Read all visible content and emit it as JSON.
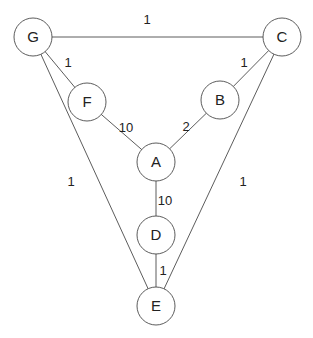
{
  "diagram": {
    "type": "weighted-undirected-graph",
    "colors": {
      "stroke": "#4a4a4a",
      "text": "#222222",
      "background": "#ffffff"
    },
    "node_radius": 19,
    "nodes": [
      {
        "id": "G",
        "label": "G",
        "x": 33,
        "y": 37
      },
      {
        "id": "C",
        "label": "C",
        "x": 282,
        "y": 37
      },
      {
        "id": "F",
        "label": "F",
        "x": 87,
        "y": 102
      },
      {
        "id": "B",
        "label": "B",
        "x": 220,
        "y": 100
      },
      {
        "id": "A",
        "label": "A",
        "x": 156,
        "y": 162
      },
      {
        "id": "D",
        "label": "D",
        "x": 156,
        "y": 235
      },
      {
        "id": "E",
        "label": "E",
        "x": 156,
        "y": 306
      }
    ],
    "edges": [
      {
        "from": "G",
        "to": "C",
        "weight": "1",
        "label_x": 147,
        "label_y": 24
      },
      {
        "from": "G",
        "to": "F",
        "weight": "1",
        "label_x": 68,
        "label_y": 67
      },
      {
        "from": "F",
        "to": "A",
        "weight": "10",
        "label_x": 126,
        "label_y": 132
      },
      {
        "from": "C",
        "to": "B",
        "weight": "1",
        "label_x": 244,
        "label_y": 67
      },
      {
        "from": "B",
        "to": "A",
        "weight": "2",
        "label_x": 186,
        "label_y": 131
      },
      {
        "from": "A",
        "to": "D",
        "weight": "10",
        "label_x": 165,
        "label_y": 205
      },
      {
        "from": "D",
        "to": "E",
        "weight": "1",
        "label_x": 163,
        "label_y": 275
      },
      {
        "from": "G",
        "to": "E",
        "weight": "1",
        "label_x": 71,
        "label_y": 186
      },
      {
        "from": "C",
        "to": "E",
        "weight": "1",
        "label_x": 243,
        "label_y": 186
      }
    ]
  }
}
